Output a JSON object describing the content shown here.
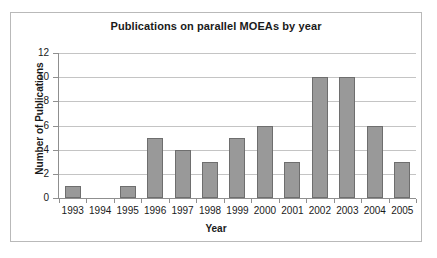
{
  "chart_data": {
    "type": "bar",
    "title": "Publications on parallel MOEAs by year",
    "xlabel": "Year",
    "ylabel": "Number of Publications",
    "categories": [
      "1993",
      "1994",
      "1995",
      "1996",
      "1997",
      "1998",
      "1999",
      "2000",
      "2001",
      "2002",
      "2003",
      "2004",
      "2005"
    ],
    "values": [
      1,
      0,
      1,
      5,
      4,
      3,
      5,
      6,
      3,
      10,
      10,
      6,
      3
    ],
    "ylim": [
      0,
      12
    ],
    "yticks": [
      0,
      2,
      4,
      6,
      8,
      10,
      12
    ],
    "ytick_labels": [
      "0",
      "2",
      "4",
      "6",
      "8",
      "10",
      "12"
    ],
    "grid": true,
    "legend": false,
    "series": [
      {
        "name": "Number of Publications",
        "values": [
          1,
          0,
          1,
          5,
          4,
          3,
          5,
          6,
          3,
          10,
          10,
          6,
          3
        ]
      }
    ]
  },
  "style": {
    "bar_fill": "#999999",
    "bar_border": "#6e6e6e",
    "gridline": "#c4c4c4",
    "axis_line": "#8f8f8f",
    "frame_border": "#b9b9b9",
    "plot_background": "#ffffff",
    "text_color": "#1a1a1a"
  }
}
